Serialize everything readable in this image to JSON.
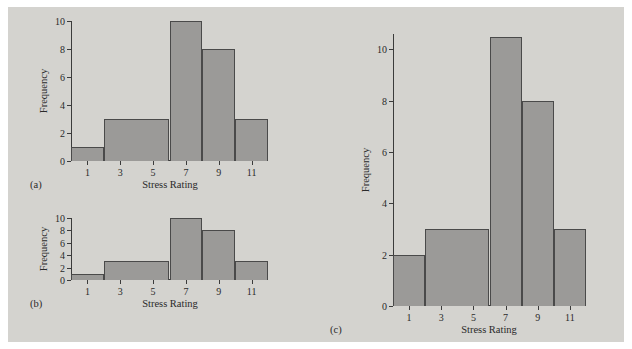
{
  "figure": {
    "background_color": "#ffffff",
    "panel_color": "#d4d3cf",
    "bar_fill_color": "#9b9a98",
    "bar_edge_color": "#4a4a4a",
    "axis_color": "#3b3b3b"
  },
  "chart_data": [
    {
      "type": "bar",
      "panel_label": "(a)",
      "title": "",
      "xlabel": "Stress Rating",
      "ylabel": "Frequency",
      "xlim": [
        0,
        12
      ],
      "ylim": [
        0,
        10
      ],
      "xticks": [
        1,
        3,
        5,
        7,
        9,
        11
      ],
      "xtick_labels": [
        "1",
        "3",
        "5",
        "7",
        "9",
        "11"
      ],
      "yticks": [
        0,
        2,
        4,
        6,
        8,
        10
      ],
      "ytick_labels": [
        "0",
        "2",
        "4",
        "6",
        "8",
        "10"
      ],
      "grid": false,
      "legend": false,
      "bin_edges": [
        0,
        2,
        6,
        8,
        10,
        12
      ],
      "categories": [
        "0-2",
        "2-6",
        "6-8",
        "8-10",
        "10-12"
      ],
      "values": [
        1,
        3,
        10,
        8,
        3
      ]
    },
    {
      "type": "bar",
      "panel_label": "(b)",
      "title": "",
      "xlabel": "Stress Rating",
      "ylabel": "Frequency",
      "xlim": [
        0,
        12
      ],
      "ylim": [
        0,
        10
      ],
      "xticks": [
        1,
        3,
        5,
        7,
        9,
        11
      ],
      "xtick_labels": [
        "1",
        "3",
        "5",
        "7",
        "9",
        "11"
      ],
      "yticks": [
        0,
        2,
        4,
        6,
        8,
        10
      ],
      "ytick_labels": [
        "0",
        "2",
        "4",
        "6",
        "8",
        "10"
      ],
      "grid": false,
      "legend": false,
      "bin_edges": [
        0,
        2,
        6,
        8,
        10,
        12
      ],
      "categories": [
        "0-2",
        "2-6",
        "6-8",
        "8-10",
        "10-12"
      ],
      "values": [
        1,
        3,
        10,
        8,
        3
      ]
    },
    {
      "type": "bar",
      "panel_label": "(c)",
      "title": "",
      "xlabel": "Stress Rating",
      "ylabel": "Frequency",
      "xlim": [
        0,
        12
      ],
      "ylim": [
        0,
        10.6
      ],
      "xticks": [
        1,
        3,
        5,
        7,
        9,
        11
      ],
      "xtick_labels": [
        "1",
        "3",
        "5",
        "7",
        "9",
        "11"
      ],
      "yticks": [
        0,
        2,
        4,
        6,
        8,
        10
      ],
      "ytick_labels": [
        "0",
        "2",
        "4",
        "6",
        "8",
        "10"
      ],
      "grid": false,
      "legend": false,
      "bin_edges": [
        0,
        2,
        6,
        8,
        10,
        12
      ],
      "categories": [
        "0-2",
        "2-6",
        "6-8",
        "8-10",
        "10-12"
      ],
      "values": [
        2,
        3,
        10.5,
        8,
        3
      ]
    }
  ]
}
